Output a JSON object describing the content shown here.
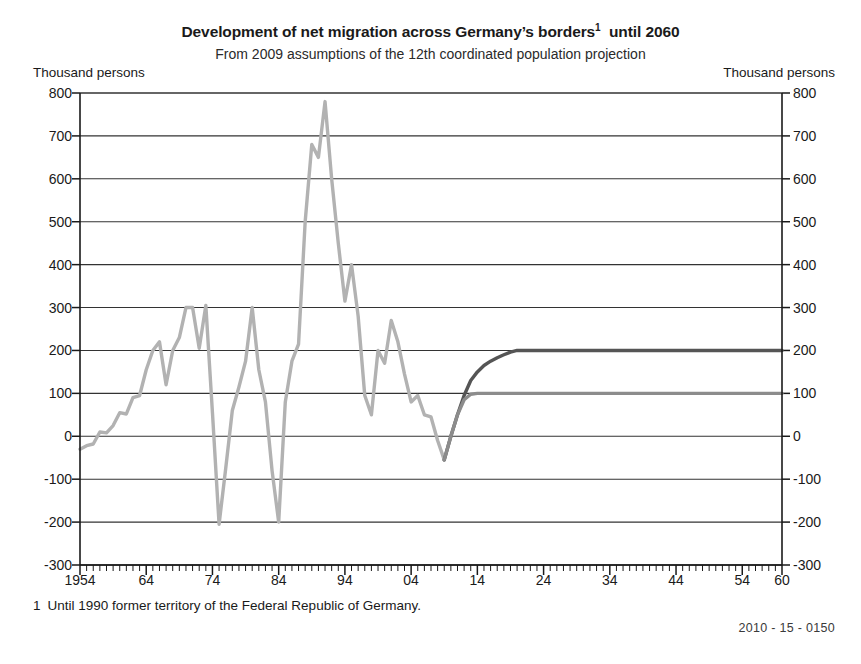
{
  "title": {
    "main": "Development of net migration across Germany’s borders",
    "footnote_marker": "1",
    "main_tail": "until 2060",
    "subtitle": "From 2009 assumptions of the 12th coordinated population projection"
  },
  "axis_units": {
    "left": "Thousand persons",
    "right": "Thousand persons"
  },
  "footnote": {
    "number": "1",
    "text": "Until 1990 former territory of the Federal Republic of Germany."
  },
  "source_code": "2010 - 15 - 0150",
  "colors": {
    "historical_line": "#b2b2b2",
    "projection_upper": "#555555",
    "projection_lower": "#8c8c8c",
    "axis": "#1a1a1a",
    "gridline": "#333333",
    "background": "#ffffff"
  },
  "chart_data": {
    "type": "line",
    "subtitle": "From 2009 assumptions of the 12th coordinated population projection",
    "xlabel": "",
    "ylabel": "Thousand persons",
    "ylim": [
      -300,
      800
    ],
    "xlim": [
      1954,
      2060
    ],
    "ytick_values": [
      800,
      700,
      600,
      500,
      400,
      300,
      200,
      100,
      0,
      -100,
      -200,
      -300
    ],
    "ytick_labels": [
      "800",
      "700",
      "600",
      "500",
      "400",
      "300",
      "200",
      "100",
      "0",
      "-100",
      "-200",
      "-300"
    ],
    "xtick_values": [
      1954,
      1964,
      1974,
      1984,
      1994,
      2004,
      2014,
      2024,
      2034,
      2044,
      2054,
      2060
    ],
    "xtick_labels": [
      "1954",
      "64",
      "74",
      "84",
      "94",
      "04",
      "14",
      "24",
      "34",
      "44",
      "54",
      "60"
    ],
    "xtick_minor_step": 1,
    "grid": "horizontal",
    "legend": "none",
    "series": [
      {
        "name": "Observed net migration",
        "style": "solid",
        "color": "#b2b2b2",
        "x": [
          1954,
          1955,
          1956,
          1957,
          1958,
          1959,
          1960,
          1961,
          1962,
          1963,
          1964,
          1965,
          1966,
          1967,
          1968,
          1969,
          1970,
          1971,
          1972,
          1973,
          1974,
          1975,
          1976,
          1977,
          1978,
          1979,
          1980,
          1981,
          1982,
          1983,
          1984,
          1985,
          1986,
          1987,
          1988,
          1989,
          1990,
          1991,
          1992,
          1993,
          1994,
          1995,
          1996,
          1997,
          1998,
          1999,
          2000,
          2001,
          2002,
          2003,
          2004,
          2005,
          2006,
          2007,
          2008,
          2009
        ],
        "values": [
          -30,
          -22,
          -18,
          10,
          8,
          25,
          55,
          52,
          90,
          95,
          155,
          200,
          220,
          120,
          200,
          230,
          300,
          300,
          205,
          305,
          55,
          -205,
          -75,
          60,
          115,
          175,
          300,
          155,
          80,
          -80,
          -200,
          80,
          175,
          215,
          500,
          680,
          650,
          780,
          600,
          450,
          315,
          400,
          280,
          95,
          50,
          200,
          170,
          270,
          220,
          145,
          80,
          95,
          50,
          45,
          -10,
          -55
        ]
      },
      {
        "name": "Projection variant: long-term net migration 200 000 persons per year",
        "style": "solid",
        "color": "#555555",
        "x": [
          2009,
          2010,
          2011,
          2012,
          2013,
          2014,
          2015,
          2016,
          2017,
          2018,
          2019,
          2020,
          2030,
          2040,
          2050,
          2060
        ],
        "values": [
          -55,
          0,
          50,
          95,
          130,
          150,
          165,
          175,
          183,
          190,
          196,
          200,
          200,
          200,
          200,
          200
        ]
      },
      {
        "name": "Projection variant: long-term net migration 100 000 persons per year",
        "style": "solid",
        "color": "#8c8c8c",
        "x": [
          2009,
          2010,
          2011,
          2012,
          2013,
          2014,
          2015,
          2020,
          2030,
          2040,
          2050,
          2060
        ],
        "values": [
          -55,
          0,
          50,
          85,
          98,
          100,
          100,
          100,
          100,
          100,
          100,
          100
        ]
      }
    ],
    "annotations": [
      {
        "text": "1 Until 1990 former territory of the Federal Republic of Germany.",
        "position": "below-axis-left"
      },
      {
        "text": "2010 - 15 - 0150",
        "position": "bottom-right"
      }
    ]
  }
}
